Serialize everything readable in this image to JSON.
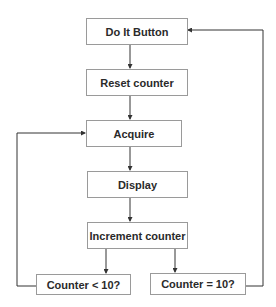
{
  "diagram": {
    "type": "flowchart",
    "nodes": [
      {
        "id": "do_it",
        "label": "Do It Button"
      },
      {
        "id": "reset",
        "label": "Reset counter"
      },
      {
        "id": "acquire",
        "label": "Acquire"
      },
      {
        "id": "display",
        "label": "Display"
      },
      {
        "id": "increment",
        "label": "Increment counter"
      },
      {
        "id": "lt10",
        "label": "Counter < 10?"
      },
      {
        "id": "eq10",
        "label": "Counter = 10?"
      }
    ],
    "edges": [
      {
        "from": "do_it",
        "to": "reset"
      },
      {
        "from": "reset",
        "to": "acquire"
      },
      {
        "from": "acquire",
        "to": "display"
      },
      {
        "from": "display",
        "to": "increment"
      },
      {
        "from": "increment",
        "to": "lt10"
      },
      {
        "from": "increment",
        "to": "eq10"
      },
      {
        "from": "lt10",
        "to": "acquire"
      },
      {
        "from": "eq10",
        "to": "do_it"
      }
    ],
    "colors": {
      "line": "#333333",
      "border": "#9a9a9a",
      "text": "#2a2a2a"
    }
  }
}
